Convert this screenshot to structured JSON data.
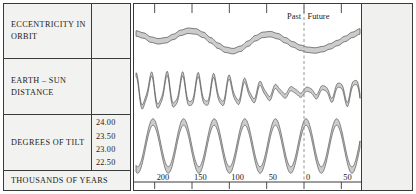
{
  "figure": {
    "rows": [
      {
        "key": "eccentricity",
        "label": "ECCENTRICITY IN ORBIT"
      },
      {
        "key": "earth_sun_distance",
        "label": "EARTH – SUN DISTANCE"
      },
      {
        "key": "degrees_of_tilt",
        "label": "DEGREES OF TILT"
      },
      {
        "key": "time_axis",
        "label": "THOUSANDS OF YEARS"
      }
    ],
    "tilt_axis_values": [
      "24.00",
      "23.50",
      "23.00",
      "22.50"
    ],
    "time_markers": {
      "past": "Past",
      "future": "Future"
    },
    "colors": {
      "band_fill": "#cccccc",
      "band_stroke": "#555555",
      "frame": "#3a3a3a",
      "panel_bg": "#f2f2f0",
      "divider_line": "#8a8a8a"
    }
  },
  "chart_data": {
    "type": "line",
    "title": "",
    "xlabel": "THOUSANDS OF YEARS",
    "ylabel": "",
    "grid": false,
    "legend": "none",
    "x_axis": {
      "tick_labels": [
        "200",
        "150",
        "100",
        "50",
        "0",
        "50"
      ],
      "tick_values": [
        -200,
        -150,
        -100,
        -50,
        0,
        50
      ],
      "direction": "past-to-future",
      "present_marker": 0,
      "xlim": [
        -225,
        75
      ]
    },
    "annotations": [
      {
        "text": "Past",
        "x": -18,
        "align": "right"
      },
      {
        "text": "Future",
        "x": 8,
        "align": "left"
      }
    ],
    "series": [
      {
        "name": "ECCENTRICITY IN ORBIT",
        "panel": 1,
        "render": "band",
        "ylim": [
          0,
          1
        ],
        "x": [
          -225,
          -215,
          -205,
          -195,
          -185,
          -175,
          -165,
          -155,
          -145,
          -135,
          -125,
          -115,
          -105,
          -95,
          -85,
          -75,
          -65,
          -55,
          -45,
          -35,
          -25,
          -15,
          -5,
          5,
          15,
          25,
          35,
          45,
          55,
          65,
          75
        ],
        "values": [
          0.78,
          0.72,
          0.6,
          0.55,
          0.58,
          0.68,
          0.8,
          0.86,
          0.84,
          0.74,
          0.58,
          0.42,
          0.3,
          0.26,
          0.33,
          0.48,
          0.64,
          0.74,
          0.76,
          0.7,
          0.58,
          0.46,
          0.36,
          0.3,
          0.28,
          0.32,
          0.4,
          0.5,
          0.62,
          0.74,
          0.84
        ],
        "band_width": 0.1
      },
      {
        "name": "EARTH – SUN DISTANCE",
        "panel": 2,
        "render": "band",
        "ylim": [
          0,
          1
        ],
        "description": "high-frequency precession oscillation, amplitude decaying toward the present then growing again",
        "period_kyr": 21,
        "amplitude_envelope_x": [
          -225,
          -185,
          -145,
          -105,
          -65,
          -25,
          0,
          25,
          50,
          75
        ],
        "amplitude_envelope": [
          0.92,
          0.95,
          0.88,
          0.8,
          0.52,
          0.22,
          0.16,
          0.3,
          0.55,
          0.8
        ],
        "band_width": 0.09
      },
      {
        "name": "DEGREES OF TILT",
        "panel": 3,
        "render": "band",
        "ylim": [
          22.3,
          24.3
        ],
        "y_ticks": [
          24.0,
          23.5,
          23.0,
          22.5
        ],
        "description": "regular obliquity oscillation",
        "period_kyr": 41,
        "amplitude_deg": 0.7,
        "mean_deg": 23.3,
        "band_width": 0.12
      }
    ]
  }
}
